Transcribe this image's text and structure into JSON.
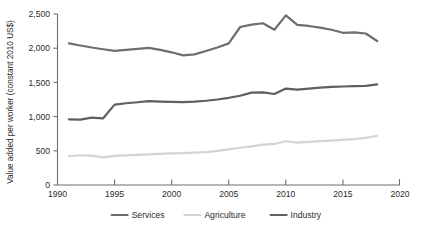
{
  "chart_data": {
    "type": "line",
    "title": "",
    "xlabel": "",
    "ylabel": "Value added per worker (constant 2010 US$)",
    "xlim": [
      1990,
      2020
    ],
    "ylim": [
      0,
      2500
    ],
    "grid": false,
    "legend_position": "bottom",
    "x_ticks": [
      "1990",
      "1995",
      "2000",
      "2005",
      "2010",
      "2015",
      "2020"
    ],
    "y_ticks": [
      "0",
      "500",
      "1,000",
      "1,500",
      "2,000",
      "2,500"
    ],
    "x": [
      1991,
      1992,
      1993,
      1994,
      1995,
      1996,
      1997,
      1998,
      1999,
      2000,
      2001,
      2002,
      2003,
      2004,
      2005,
      2006,
      2007,
      2008,
      2009,
      2010,
      2011,
      2012,
      2013,
      2014,
      2015,
      2016,
      2017,
      2018
    ],
    "series": [
      {
        "name": "Services",
        "color": "#6e6e6e",
        "width": 2.2,
        "values": [
          2070,
          2040,
          2010,
          1985,
          1960,
          1975,
          1990,
          2005,
          1975,
          1940,
          1895,
          1910,
          1960,
          2010,
          2070,
          2310,
          2345,
          2365,
          2270,
          2480,
          2340,
          2325,
          2300,
          2270,
          2225,
          2230,
          2215,
          2105
        ]
      },
      {
        "name": "Agriculture",
        "color": "#d4d4d4",
        "width": 2.2,
        "values": [
          420,
          435,
          430,
          405,
          425,
          432,
          440,
          448,
          455,
          462,
          465,
          472,
          482,
          498,
          520,
          545,
          565,
          590,
          600,
          640,
          620,
          630,
          640,
          650,
          660,
          672,
          690,
          720
        ]
      },
      {
        "name": "Industry",
        "color": "#5f5f5f",
        "width": 2.2,
        "values": [
          960,
          955,
          985,
          975,
          1175,
          1195,
          1210,
          1225,
          1220,
          1215,
          1212,
          1218,
          1232,
          1250,
          1275,
          1305,
          1350,
          1355,
          1330,
          1410,
          1395,
          1410,
          1425,
          1435,
          1440,
          1445,
          1450,
          1470
        ]
      }
    ],
    "legend": [
      {
        "label": "Services",
        "color": "#6e6e6e"
      },
      {
        "label": "Agriculture",
        "color": "#d4d4d4"
      },
      {
        "label": "Industry",
        "color": "#5f5f5f"
      }
    ]
  }
}
